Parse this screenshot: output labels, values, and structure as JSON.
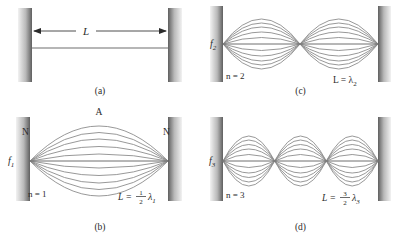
{
  "figure": {
    "curve_color": "#8c8c8c",
    "axis_color": "#6e6e6e",
    "wall_color_dark": "#6b6b6b",
    "wall_color_light": "#efefef",
    "text_color": "#2b2b2b"
  },
  "panels": [
    {
      "id": "a",
      "caption": "(a)",
      "length_label": "L",
      "harmonic_label": "",
      "frequency_label": "",
      "wavelength_label": "",
      "node_label": "",
      "antinode_label": "",
      "n": 0,
      "loops": 0
    },
    {
      "id": "c",
      "caption": "(c)",
      "length_label": "",
      "harmonic_label": "n = 2",
      "frequency_label": "f",
      "frequency_sub": "2",
      "wavelength_prefix": "L = ",
      "wavelength_symbol": "λ",
      "wavelength_sub": "2",
      "wavelength_fraction_num": "",
      "wavelength_fraction_den": "",
      "n": 2,
      "loops": 2
    },
    {
      "id": "b",
      "caption": "(b)",
      "length_label": "",
      "harmonic_label": "n = 1",
      "frequency_label": "f",
      "frequency_sub": "1",
      "wavelength_prefix": "L = ",
      "wavelength_symbol": "λ",
      "wavelength_sub": "1",
      "wavelength_fraction_num": "1",
      "wavelength_fraction_den": "2",
      "node_label": "N",
      "antinode_label": "A",
      "n": 1,
      "loops": 1
    },
    {
      "id": "d",
      "caption": "(d)",
      "length_label": "",
      "harmonic_label": "n = 3",
      "frequency_label": "f",
      "frequency_sub": "3",
      "wavelength_prefix": "L = ",
      "wavelength_symbol": "λ",
      "wavelength_sub": "3",
      "wavelength_fraction_num": "3",
      "wavelength_fraction_den": "2",
      "n": 3,
      "loops": 3
    }
  ],
  "panel_a": {
    "caption": "(a)",
    "dimension_label": "L"
  },
  "panel_b": {
    "caption": "(b)",
    "harmonic": "n = 1",
    "freq_symbol": "f",
    "freq_sub": "1",
    "len_prefix": "L = ",
    "frac_num": "1",
    "frac_den": "2",
    "lambda_symbol": "λ",
    "lambda_sub": "1",
    "node_left": "N",
    "node_right": "N",
    "antinode": "A"
  },
  "panel_c": {
    "caption": "(c)",
    "harmonic": "n = 2",
    "freq_symbol": "f",
    "freq_sub": "2",
    "len_prefix": "L = ",
    "lambda_symbol": "λ",
    "lambda_sub": "2"
  },
  "panel_d": {
    "caption": "(d)",
    "harmonic": "n = 3",
    "freq_symbol": "f",
    "freq_sub": "3",
    "len_prefix": "L = ",
    "frac_num": "3",
    "frac_den": "2",
    "lambda_symbol": "λ",
    "lambda_sub": "3"
  }
}
